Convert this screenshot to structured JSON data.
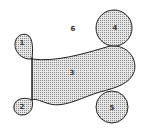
{
  "diagram": {
    "type": "region-diagram",
    "fill_pattern_color": "#9a9a9a",
    "stroke_color": "#222222",
    "regions": [
      {
        "id": "1",
        "label": "1",
        "shape": "teardrop",
        "x": 22,
        "y": 43
      },
      {
        "id": "2",
        "label": "2",
        "shape": "circle",
        "x": 22,
        "y": 107
      },
      {
        "id": "3",
        "label": "3",
        "shape": "blob",
        "x": 72,
        "y": 73
      },
      {
        "id": "4",
        "label": "4",
        "shape": "circle",
        "x": 115,
        "y": 28
      },
      {
        "id": "5",
        "label": "5",
        "shape": "circle",
        "x": 112,
        "y": 108
      },
      {
        "id": "6",
        "label": "6",
        "shape": "outer-region",
        "x": 73,
        "y": 29
      }
    ]
  }
}
